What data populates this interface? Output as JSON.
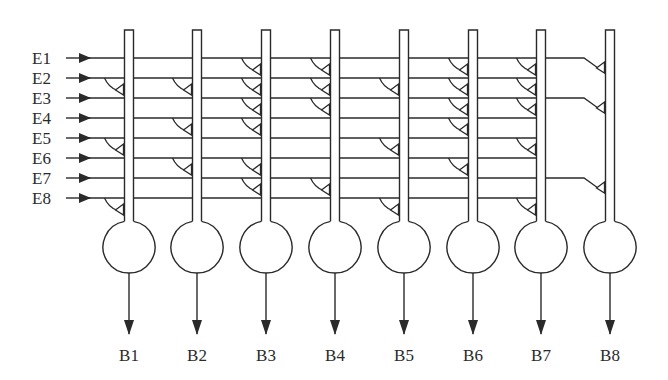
{
  "diagram": {
    "type": "neural-network-synapse-matrix",
    "inputs": [
      {
        "label": "E1",
        "y": 58
      },
      {
        "label": "E2",
        "y": 78
      },
      {
        "label": "E3",
        "y": 98
      },
      {
        "label": "E4",
        "y": 118
      },
      {
        "label": "E5",
        "y": 138
      },
      {
        "label": "E6",
        "y": 158
      },
      {
        "label": "E7",
        "y": 178
      },
      {
        "label": "E8",
        "y": 198
      }
    ],
    "outputs": [
      {
        "label": "B1",
        "x": 129,
        "synapses": [
          "E2",
          "E5",
          "E8"
        ]
      },
      {
        "label": "B2",
        "x": 197,
        "synapses": [
          "E2",
          "E4",
          "E6"
        ]
      },
      {
        "label": "B3",
        "x": 266,
        "synapses": [
          "E1",
          "E2",
          "E3",
          "E4",
          "E6",
          "E7"
        ]
      },
      {
        "label": "B4",
        "x": 335,
        "synapses": [
          "E1",
          "E2",
          "E3",
          "E7"
        ]
      },
      {
        "label": "B5",
        "x": 404,
        "synapses": [
          "E2",
          "E5",
          "E8"
        ]
      },
      {
        "label": "B6",
        "x": 473,
        "synapses": [
          "E1",
          "E2",
          "E3",
          "E4",
          "E6"
        ]
      },
      {
        "label": "B7",
        "x": 541,
        "synapses": [
          "E1",
          "E2",
          "E3",
          "E5",
          "E8"
        ]
      },
      {
        "label": "B8",
        "x": 610,
        "synapses": [
          "E1",
          "E3",
          "E7"
        ],
        "bent_connections": true
      }
    ],
    "extended_inputs": [
      "E1",
      "E3",
      "E7"
    ],
    "stroke_color": "#2a2a2a"
  }
}
